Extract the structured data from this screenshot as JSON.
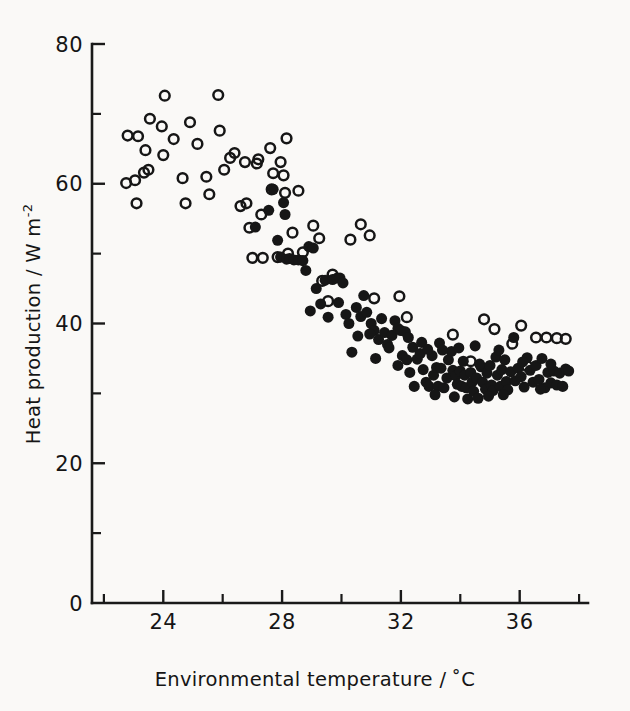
{
  "figure": {
    "background_color": "#faf9f7",
    "ink_color": "#161616"
  },
  "axes": {
    "x_title_main": "Environmental temperature /",
    "x_title_unit": "˚C",
    "y_title_main": "Heat production / W m",
    "y_title_sup": "-2",
    "x_major_labels": [
      "24",
      "28",
      "32",
      "36"
    ],
    "y_major_labels": [
      "0",
      "20",
      "40",
      "60",
      "80"
    ]
  },
  "chart_data": {
    "type": "scatter",
    "title": "",
    "xlabel": "Environmental temperature / ˚C",
    "ylabel": "Heat production / W m⁻²",
    "xlim": [
      21.6,
      38.3
    ],
    "ylim": [
      0,
      80
    ],
    "x_major_ticks": [
      24,
      28,
      32,
      36
    ],
    "x_minor_ticks": [
      22,
      26,
      30,
      34,
      38
    ],
    "y_major_ticks": [
      0,
      20,
      40,
      60,
      80
    ],
    "y_minor_ticks": [
      10,
      30,
      50,
      70
    ],
    "grid": false,
    "legend": "none",
    "marker_size_px": 11.5,
    "series": [
      {
        "name": "open",
        "marker": "open-circle",
        "color": "#161616",
        "points": [
          [
            22.75,
            60.1
          ],
          [
            22.8,
            66.9
          ],
          [
            23.15,
            66.8
          ],
          [
            23.05,
            60.5
          ],
          [
            23.1,
            57.2
          ],
          [
            23.55,
            69.3
          ],
          [
            23.4,
            64.8
          ],
          [
            23.5,
            62.0
          ],
          [
            23.35,
            61.6
          ],
          [
            24.05,
            72.6
          ],
          [
            23.95,
            68.2
          ],
          [
            24.0,
            64.1
          ],
          [
            24.35,
            66.4
          ],
          [
            24.65,
            60.8
          ],
          [
            24.9,
            68.8
          ],
          [
            24.75,
            57.2
          ],
          [
            25.15,
            65.7
          ],
          [
            25.45,
            61.0
          ],
          [
            25.55,
            58.5
          ],
          [
            25.85,
            72.7
          ],
          [
            25.9,
            67.6
          ],
          [
            26.05,
            62.0
          ],
          [
            26.25,
            63.7
          ],
          [
            26.4,
            64.4
          ],
          [
            26.6,
            56.8
          ],
          [
            26.75,
            63.1
          ],
          [
            26.8,
            57.2
          ],
          [
            26.9,
            53.7
          ],
          [
            27.0,
            49.4
          ],
          [
            27.15,
            62.9
          ],
          [
            27.2,
            63.5
          ],
          [
            27.35,
            49.4
          ],
          [
            27.3,
            55.6
          ],
          [
            27.6,
            65.1
          ],
          [
            27.7,
            61.5
          ],
          [
            27.65,
            59.2
          ],
          [
            27.85,
            49.5
          ],
          [
            27.95,
            63.1
          ],
          [
            28.05,
            61.2
          ],
          [
            28.15,
            66.5
          ],
          [
            28.1,
            58.7
          ],
          [
            28.2,
            50.0
          ],
          [
            28.35,
            53.0
          ],
          [
            28.55,
            59.0
          ],
          [
            28.7,
            50.2
          ],
          [
            29.05,
            54.0
          ],
          [
            29.25,
            52.2
          ],
          [
            29.35,
            46.1
          ],
          [
            29.55,
            43.2
          ],
          [
            29.7,
            47.0
          ],
          [
            30.3,
            52.0
          ],
          [
            30.65,
            54.2
          ],
          [
            30.95,
            52.6
          ],
          [
            31.1,
            43.6
          ],
          [
            31.95,
            43.9
          ],
          [
            32.2,
            40.9
          ],
          [
            33.75,
            38.4
          ],
          [
            34.35,
            34.6
          ],
          [
            34.8,
            40.6
          ],
          [
            35.15,
            39.2
          ],
          [
            35.75,
            37.1
          ],
          [
            36.05,
            39.7
          ],
          [
            36.25,
            33.9
          ],
          [
            36.55,
            38.0
          ],
          [
            37.25,
            37.9
          ],
          [
            37.55,
            37.8
          ],
          [
            36.9,
            38.0
          ]
        ]
      },
      {
        "name": "filled",
        "marker": "filled-circle",
        "color": "#161616",
        "points": [
          [
            27.1,
            53.8
          ],
          [
            27.55,
            56.2
          ],
          [
            27.7,
            59.2
          ],
          [
            27.85,
            51.9
          ],
          [
            27.95,
            49.5
          ],
          [
            28.05,
            57.3
          ],
          [
            28.1,
            55.6
          ],
          [
            28.15,
            49.2
          ],
          [
            28.25,
            49.3
          ],
          [
            28.4,
            49.1
          ],
          [
            28.55,
            49.1
          ],
          [
            28.7,
            49.0
          ],
          [
            28.8,
            47.6
          ],
          [
            28.9,
            51.0
          ],
          [
            29.05,
            50.8
          ],
          [
            28.95,
            41.8
          ],
          [
            29.15,
            45.0
          ],
          [
            29.3,
            42.8
          ],
          [
            29.45,
            46.2
          ],
          [
            29.55,
            40.9
          ],
          [
            29.7,
            46.3
          ],
          [
            29.85,
            46.5
          ],
          [
            29.95,
            46.5
          ],
          [
            30.05,
            45.8
          ],
          [
            30.15,
            41.3
          ],
          [
            30.25,
            40.0
          ],
          [
            30.35,
            35.9
          ],
          [
            30.5,
            42.3
          ],
          [
            30.65,
            41.0
          ],
          [
            30.75,
            44.0
          ],
          [
            30.85,
            41.6
          ],
          [
            31.0,
            40.0
          ],
          [
            31.1,
            39.0
          ],
          [
            31.25,
            37.7
          ],
          [
            31.35,
            40.7
          ],
          [
            31.45,
            38.7
          ],
          [
            31.55,
            37.0
          ],
          [
            31.6,
            36.5
          ],
          [
            31.7,
            38.3
          ],
          [
            31.8,
            40.4
          ],
          [
            31.9,
            39.3
          ],
          [
            32.0,
            39.0
          ],
          [
            32.05,
            35.4
          ],
          [
            32.15,
            38.8
          ],
          [
            32.2,
            34.8
          ],
          [
            32.3,
            33.0
          ],
          [
            32.45,
            31.0
          ],
          [
            32.55,
            34.9
          ],
          [
            32.65,
            35.7
          ],
          [
            32.75,
            33.4
          ],
          [
            32.85,
            31.6
          ],
          [
            32.95,
            31.0
          ],
          [
            33.05,
            35.4
          ],
          [
            33.1,
            32.6
          ],
          [
            33.2,
            33.7
          ],
          [
            33.25,
            31.0
          ],
          [
            33.35,
            33.6
          ],
          [
            33.45,
            30.8
          ],
          [
            33.55,
            32.2
          ],
          [
            33.6,
            34.8
          ],
          [
            33.7,
            36.0
          ],
          [
            33.75,
            33.3
          ],
          [
            33.85,
            32.5
          ],
          [
            33.9,
            31.3
          ],
          [
            34.0,
            33.2
          ],
          [
            34.05,
            31.0
          ],
          [
            34.15,
            32.6
          ],
          [
            34.2,
            30.8
          ],
          [
            34.25,
            29.2
          ],
          [
            34.35,
            33.0
          ],
          [
            34.4,
            31.6
          ],
          [
            34.45,
            30.3
          ],
          [
            34.55,
            32.2
          ],
          [
            34.6,
            29.3
          ],
          [
            34.7,
            33.8
          ],
          [
            34.75,
            31.6
          ],
          [
            34.85,
            30.6
          ],
          [
            34.9,
            32.9
          ],
          [
            35.0,
            34.0
          ],
          [
            35.05,
            31.2
          ],
          [
            35.1,
            30.4
          ],
          [
            35.2,
            35.2
          ],
          [
            35.25,
            32.6
          ],
          [
            35.35,
            31.0
          ],
          [
            35.4,
            33.4
          ],
          [
            35.5,
            34.8
          ],
          [
            35.55,
            31.7
          ],
          [
            35.6,
            30.5
          ],
          [
            35.7,
            33.1
          ],
          [
            35.8,
            38.0
          ],
          [
            35.85,
            31.8
          ],
          [
            35.95,
            33.6
          ],
          [
            36.05,
            32.4
          ],
          [
            36.15,
            30.9
          ],
          [
            36.25,
            35.1
          ],
          [
            36.35,
            33.3
          ],
          [
            36.45,
            31.6
          ],
          [
            36.55,
            34.0
          ],
          [
            36.65,
            32.0
          ],
          [
            36.75,
            35.0
          ],
          [
            36.85,
            30.8
          ],
          [
            36.95,
            33.0
          ],
          [
            37.05,
            31.5
          ],
          [
            37.15,
            33.2
          ],
          [
            37.25,
            31.2
          ],
          [
            37.35,
            32.9
          ],
          [
            37.45,
            31.0
          ],
          [
            37.55,
            33.5
          ],
          [
            37.65,
            33.2
          ],
          [
            33.3,
            37.2
          ],
          [
            33.95,
            36.5
          ],
          [
            34.5,
            36.8
          ],
          [
            35.3,
            36.2
          ],
          [
            32.4,
            36.6
          ],
          [
            32.7,
            37.3
          ],
          [
            33.15,
            29.8
          ],
          [
            33.8,
            29.5
          ],
          [
            34.1,
            34.6
          ],
          [
            34.65,
            34.2
          ],
          [
            35.45,
            29.8
          ],
          [
            36.1,
            34.5
          ],
          [
            31.15,
            35.0
          ],
          [
            31.9,
            34.0
          ],
          [
            32.25,
            38.0
          ],
          [
            30.95,
            38.5
          ],
          [
            29.9,
            43.0
          ],
          [
            30.55,
            38.2
          ],
          [
            33.4,
            36.2
          ],
          [
            32.9,
            36.3
          ],
          [
            34.95,
            29.6
          ],
          [
            36.7,
            30.6
          ],
          [
            37.05,
            34.2
          ]
        ]
      }
    ]
  }
}
